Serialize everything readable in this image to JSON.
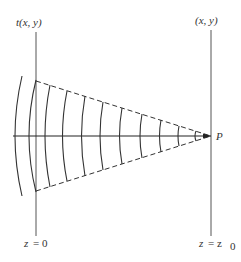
{
  "diagram": {
    "labels": {
      "left_top": "t(x, y)",
      "right_top": "(x, y)",
      "point": "P",
      "left_bottom_var": "z",
      "left_bottom_eq": "= 0",
      "right_bottom_var": "z",
      "right_bottom_eq": "= z",
      "right_bottom_sub": "0"
    },
    "colors": {
      "line": "#333333",
      "plane": "#555555",
      "background": "#ffffff"
    },
    "geometry": {
      "axis_y": 136,
      "left_plane_x": 36,
      "right_plane_x": 211,
      "cone_top_at_left": 81,
      "cone_bottom_at_left": 191,
      "wavefront_axis_crossings": [
        15,
        29,
        45,
        63,
        82,
        100,
        120,
        140,
        160,
        178,
        195,
        205
      ]
    }
  }
}
